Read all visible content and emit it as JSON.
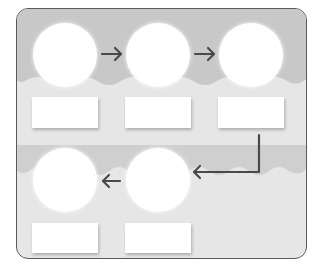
{
  "diagram": {
    "type": "flow-cycle",
    "colors": {
      "frame_border": "#5a5a5a",
      "band_dark": "#c8c8c8",
      "band_light": "#e6e6e6",
      "node_fill": "#ffffff",
      "arrow": "#4a4a4a"
    },
    "row1": {
      "nodes": [
        {
          "id": "node-1",
          "label": ""
        },
        {
          "id": "node-2",
          "label": ""
        },
        {
          "id": "node-3",
          "label": ""
        }
      ],
      "boxes": [
        {
          "id": "box-1",
          "text": ""
        },
        {
          "id": "box-2",
          "text": ""
        },
        {
          "id": "box-3",
          "text": ""
        }
      ]
    },
    "row2": {
      "nodes": [
        {
          "id": "node-4",
          "label": ""
        },
        {
          "id": "node-5",
          "label": ""
        }
      ],
      "boxes": [
        {
          "id": "box-4",
          "text": ""
        },
        {
          "id": "box-5",
          "text": ""
        }
      ]
    },
    "arrows": [
      {
        "from": "node-1",
        "to": "node-2",
        "direction": "right"
      },
      {
        "from": "node-2",
        "to": "node-3",
        "direction": "right"
      },
      {
        "from": "box-3",
        "to": "node-5",
        "direction": "down-then-left"
      },
      {
        "from": "node-5",
        "to": "node-4",
        "direction": "left"
      }
    ]
  }
}
